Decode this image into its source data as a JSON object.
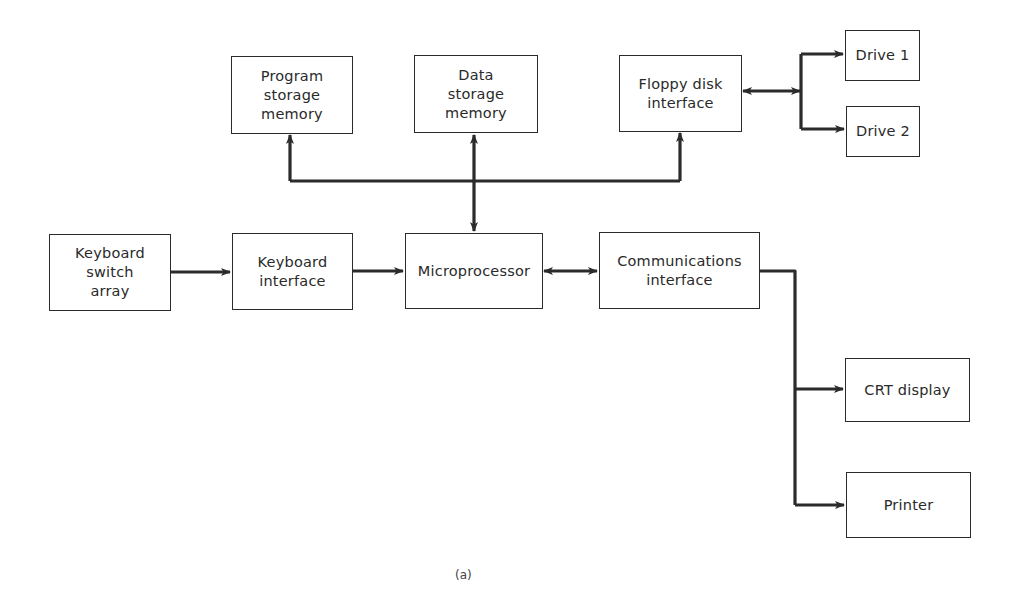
{
  "diagram": {
    "caption": "(a)",
    "colors": {
      "line": "#2b2b2b",
      "text": "#2a2a2a",
      "background": "#ffffff"
    },
    "blocks": {
      "program_storage": {
        "label": "Program\nstorage\nmemory"
      },
      "data_storage": {
        "label": "Data\nstorage\nmemory"
      },
      "floppy_interface": {
        "label": "Floppy disk\ninterface"
      },
      "drive1": {
        "label": "Drive 1"
      },
      "drive2": {
        "label": "Drive 2"
      },
      "keyboard_switch": {
        "label": "Keyboard\nswitch\narray"
      },
      "keyboard_interface": {
        "label": "Keyboard\ninterface"
      },
      "microprocessor": {
        "label": "Microprocessor"
      },
      "comm_interface": {
        "label": "Communications\ninterface"
      },
      "crt_display": {
        "label": "CRT display"
      },
      "printer": {
        "label": "Printer"
      }
    },
    "connections": [
      {
        "from": "Keyboard switch array",
        "to": "Keyboard interface",
        "type": "one-way"
      },
      {
        "from": "Keyboard interface",
        "to": "Microprocessor",
        "type": "one-way"
      },
      {
        "from": "Microprocessor",
        "to": "Communications interface",
        "type": "bidirectional"
      },
      {
        "from": "Microprocessor",
        "to": "Memory bus",
        "type": "bidirectional"
      },
      {
        "from": "Memory bus",
        "to": "Program storage memory",
        "type": "one-way"
      },
      {
        "from": "Memory bus",
        "to": "Data storage memory",
        "type": "one-way"
      },
      {
        "from": "Memory bus",
        "to": "Floppy disk interface",
        "type": "one-way"
      },
      {
        "from": "Floppy disk interface",
        "to": "Drive bus",
        "type": "bidirectional"
      },
      {
        "from": "Drive bus",
        "to": "Drive 1",
        "type": "one-way"
      },
      {
        "from": "Drive bus",
        "to": "Drive 2",
        "type": "one-way"
      },
      {
        "from": "Communications interface",
        "to": "CRT display",
        "type": "one-way"
      },
      {
        "from": "Communications interface",
        "to": "Printer",
        "type": "one-way"
      }
    ]
  }
}
